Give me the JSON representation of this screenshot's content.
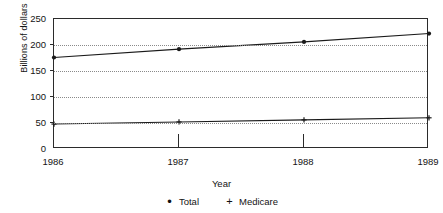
{
  "chart_data": {
    "type": "line",
    "title": "",
    "xlabel": "Year",
    "ylabel": "Billions of dollars",
    "categories": [
      "1986",
      "1987",
      "1988",
      "1989"
    ],
    "x": [
      1986,
      1987,
      1988,
      1989
    ],
    "xlim": [
      1986,
      1989
    ],
    "ylim": [
      0,
      250
    ],
    "yticks": [
      0,
      50,
      100,
      150,
      200,
      250
    ],
    "ytick_labels": [
      "0",
      "50",
      "100",
      "150",
      "200",
      "250"
    ],
    "grid": "horizontal-dotted",
    "legend_position": "bottom-center",
    "series": [
      {
        "name": "Total",
        "marker": "dot",
        "marker_glyph": "•",
        "color": "#1a1a1a",
        "values": [
          176,
          192,
          206,
          222
        ]
      },
      {
        "name": "Medicare",
        "marker": "plus",
        "marker_glyph": "+",
        "color": "#1a1a1a",
        "values": [
          48,
          52,
          56,
          60
        ]
      }
    ]
  },
  "legend": {
    "items": [
      {
        "glyph": "•",
        "label": "Total"
      },
      {
        "glyph": "+",
        "label": "Medicare"
      }
    ]
  },
  "axes": {
    "y_title": "Billions of dollars",
    "x_title": "Year"
  }
}
